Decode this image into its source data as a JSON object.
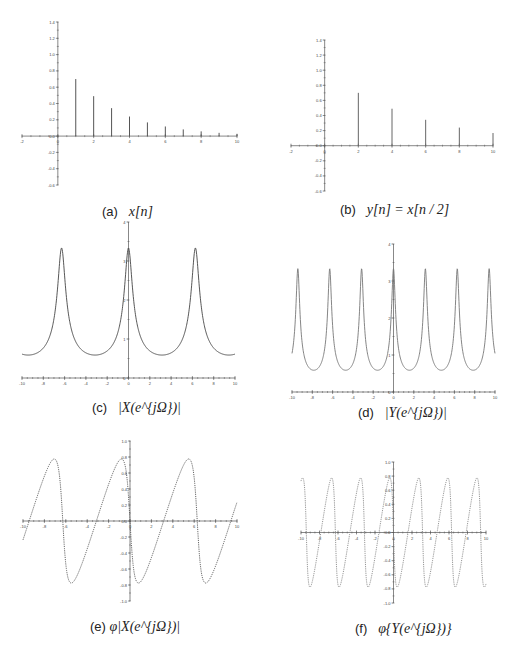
{
  "figure": {
    "panels": [
      {
        "id": "a",
        "label": "(a)",
        "caption": "x[n]"
      },
      {
        "id": "b",
        "label": "(b)",
        "caption": "y[n] = x[n / 2]"
      },
      {
        "id": "c",
        "label": "(c)",
        "caption": "|X(e^{jΩ})|"
      },
      {
        "id": "d",
        "label": "(d)",
        "caption": "|Y(e^{jΩ})|"
      },
      {
        "id": "e",
        "label": "(e)",
        "caption": "φ|X(e^{jΩ})|"
      },
      {
        "id": "f",
        "label": "(f)",
        "caption": "φ{Y(e^{jΩ})}"
      }
    ]
  },
  "chart_data": [
    {
      "id": "a",
      "type": "stem",
      "title": "(a) x[n]",
      "xlabel": "n",
      "ylabel": "",
      "x": [
        1,
        2,
        3,
        4,
        5,
        6,
        7,
        8,
        9,
        10
      ],
      "values": [
        0.7,
        0.49,
        0.343,
        0.24,
        0.168,
        0.118,
        0.082,
        0.058,
        0.04,
        0.028
      ],
      "xlim": [
        -2,
        10
      ],
      "ylim": [
        -0.6,
        1.4
      ],
      "xticks": [
        -2,
        0,
        2,
        4,
        6,
        8,
        10
      ],
      "xtick_labels": [
        "-2",
        "0",
        "2",
        "4",
        "6",
        "8",
        "10"
      ],
      "yticks": [
        -0.6,
        -0.4,
        -0.2,
        0.0,
        0.2,
        0.4,
        0.6,
        0.8,
        1.0,
        1.2,
        1.4
      ],
      "ytick_labels": [
        "-0.6",
        "-0.4",
        "-0.2",
        "0.0",
        "0.2",
        "0.4",
        "0.6",
        "0.8",
        "1.0",
        "1.2",
        "1.4"
      ],
      "grid": false,
      "color": "#555555"
    },
    {
      "id": "b",
      "type": "stem",
      "title": "(b) y[n] = x[n/2]",
      "xlabel": "n",
      "ylabel": "",
      "x": [
        2,
        4,
        6,
        8,
        10
      ],
      "values": [
        0.7,
        0.49,
        0.343,
        0.24,
        0.168
      ],
      "xlim": [
        -2,
        10
      ],
      "ylim": [
        -0.6,
        1.4
      ],
      "xticks": [
        -2,
        0,
        2,
        4,
        6,
        8,
        10
      ],
      "xtick_labels": [
        "-2",
        "0",
        "2",
        "4",
        "6",
        "8",
        "10"
      ],
      "yticks": [
        -0.6,
        -0.4,
        -0.2,
        0.0,
        0.2,
        0.4,
        0.6,
        0.8,
        1.0,
        1.2,
        1.4
      ],
      "ytick_labels": [
        "-0.6",
        "-0.4",
        "-0.2",
        "0.0",
        "0.2",
        "0.4",
        "0.6",
        "0.8",
        "1.0",
        "1.2",
        "1.4"
      ],
      "grid": false,
      "color": "#666666"
    },
    {
      "id": "c",
      "type": "line",
      "title": "(c) |X(e^jΩ)|",
      "xlabel": "Ω",
      "ylabel": "",
      "function": "1/|1-0.7e^{-jΩ}|",
      "x": [
        -10,
        -9,
        -8,
        -7,
        -6.283,
        -6,
        -5,
        -4,
        -3.14,
        -2,
        -1,
        0,
        1,
        2,
        3.14,
        4,
        5,
        6,
        6.283,
        7,
        8,
        9,
        10
      ],
      "values": [
        0.63,
        0.59,
        0.72,
        1.67,
        3.33,
        2.77,
        1.04,
        0.65,
        0.59,
        0.7,
        1.25,
        3.33,
        1.25,
        0.7,
        0.59,
        0.65,
        1.04,
        2.77,
        3.33,
        1.67,
        0.72,
        0.59,
        0.63
      ],
      "peak": 3.33,
      "min": 0.588,
      "xlim": [
        -10,
        10
      ],
      "ylim": [
        0,
        4
      ],
      "xticks": [
        -10,
        -8,
        -6,
        -4,
        -2,
        0,
        2,
        4,
        6,
        8,
        10
      ],
      "xtick_labels": [
        "-10",
        "-8",
        "-6",
        "-4",
        "-2",
        "0",
        "2",
        "4",
        "6",
        "8",
        "10"
      ],
      "yticks": [
        0,
        1,
        2,
        3,
        4
      ],
      "ytick_labels": [
        "0",
        "1",
        "2",
        "3",
        "4"
      ],
      "grid": false,
      "color": "#444444",
      "linestyle": "solid"
    },
    {
      "id": "d",
      "type": "line",
      "title": "(d) |Y(e^jΩ)|",
      "xlabel": "Ω",
      "ylabel": "",
      "function": "1/|1-0.7e^{-j2Ω}|",
      "x": [
        -10,
        -9.42,
        -7.85,
        -6.28,
        -4.71,
        -3.14,
        -1.57,
        0,
        1.57,
        3.14,
        4.71,
        6.28,
        7.85,
        9.42,
        10
      ],
      "values": [
        1.07,
        3.33,
        0.59,
        3.33,
        0.59,
        3.33,
        0.59,
        3.33,
        0.59,
        3.33,
        0.59,
        3.33,
        0.59,
        3.33,
        1.07
      ],
      "peak": 3.33,
      "min": 0.588,
      "xlim": [
        -10,
        10
      ],
      "ylim": [
        0,
        4
      ],
      "xticks": [
        -10,
        -8,
        -6,
        -4,
        -2,
        0,
        2,
        4,
        6,
        8,
        10
      ],
      "xtick_labels": [
        "-10",
        "-8",
        "-6",
        "-4",
        "-2",
        "0",
        "2",
        "4",
        "6",
        "8",
        "10"
      ],
      "yticks": [
        0,
        1,
        2,
        3,
        4
      ],
      "ytick_labels": [
        "0",
        "1",
        "2",
        "3",
        "4"
      ],
      "grid": false,
      "color": "#777777",
      "linestyle": "solid"
    },
    {
      "id": "e",
      "type": "line",
      "title": "(e) φ|X(e^jΩ)|",
      "xlabel": "Ω",
      "ylabel": "",
      "function": "-atan(0.7 sinΩ / (1 - 0.7 cosΩ))",
      "x": [
        -10,
        -9.5,
        -8.0,
        -7.08,
        -6.283,
        -5.49,
        -3.14,
        -0.795,
        0,
        0.795,
        3.14,
        5.49,
        6.283,
        7.08,
        9.42,
        10
      ],
      "values": [
        -0.24,
        0.0,
        0.62,
        0.775,
        0.0,
        -0.775,
        0.0,
        0.775,
        0.0,
        -0.775,
        0.0,
        0.775,
        0.0,
        -0.775,
        0.0,
        0.24
      ],
      "xlim": [
        -10,
        10
      ],
      "ylim": [
        -1.0,
        1.0
      ],
      "xticks": [
        -10,
        -8,
        -6,
        -4,
        -2,
        0,
        2,
        4,
        6,
        8,
        10
      ],
      "xtick_labels": [
        "-10",
        "-8",
        "-6",
        "-4",
        "-2",
        "0",
        "2",
        "4",
        "6",
        "8",
        "10"
      ],
      "yticks": [
        -1.0,
        -0.8,
        -0.6,
        -0.4,
        -0.2,
        0.0,
        0.2,
        0.4,
        0.6,
        0.8,
        1.0
      ],
      "ytick_labels": [
        "-1.0",
        "-0.8",
        "-0.6",
        "-0.4",
        "-0.2",
        "0.0",
        "0.2",
        "0.4",
        "0.6",
        "0.8",
        "1.0"
      ],
      "grid": false,
      "color": "#555555",
      "linestyle": "dotted"
    },
    {
      "id": "f",
      "type": "line",
      "title": "(f) φ{Y(e^jΩ)}",
      "xlabel": "Ω",
      "ylabel": "",
      "function": "-atan(0.7 sin2Ω / (1 - 0.7 cos2Ω))",
      "x": [
        -10,
        -9.82,
        -9.03,
        -7.85,
        -6.68,
        -6.28,
        -5.89,
        -4.71,
        -3.54,
        -3.14,
        -2.75,
        -1.57,
        -0.4,
        0,
        0.4,
        1.57,
        2.75,
        3.14,
        3.54,
        4.71,
        5.89,
        6.28,
        6.68,
        7.85,
        9.03,
        9.42,
        9.82,
        10
      ],
      "values": [
        0.6,
        0.775,
        -0.775,
        0.0,
        0.775,
        0.0,
        -0.775,
        0.0,
        0.775,
        0.0,
        -0.775,
        0.0,
        0.775,
        0.0,
        -0.775,
        0.0,
        0.775,
        0.0,
        -0.775,
        0.0,
        0.775,
        0.0,
        -0.775,
        0.0,
        0.775,
        0.0,
        -0.775,
        -0.6
      ],
      "xlim": [
        -10,
        10
      ],
      "ylim": [
        -1.0,
        1.0
      ],
      "xticks": [
        -10,
        -8,
        -6,
        -4,
        -2,
        0,
        2,
        4,
        6,
        8,
        10
      ],
      "xtick_labels": [
        "-10",
        "-8",
        "-6",
        "-4",
        "-2",
        "0",
        "2",
        "4",
        "6",
        "8",
        "10"
      ],
      "yticks": [
        -1.0,
        -0.8,
        -0.6,
        -0.4,
        -0.2,
        0.0,
        0.2,
        0.4,
        0.6,
        0.8,
        1.0
      ],
      "ytick_labels": [
        "-1.0",
        "-0.8",
        "-0.6",
        "-0.4",
        "-0.2",
        "0.0",
        "0.2",
        "0.4",
        "0.6",
        "0.8",
        "1.0"
      ],
      "grid": false,
      "color": "#888888",
      "linestyle": "dotted"
    }
  ]
}
